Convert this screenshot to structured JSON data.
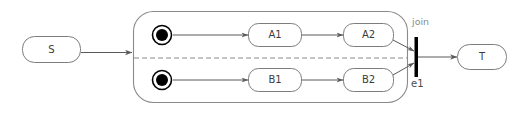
{
  "diagram": {
    "canvas": {
      "width": 518,
      "height": 122,
      "background": "#ffffff"
    },
    "colors": {
      "node_stroke": "#7d7d7d",
      "composite_stroke": "#8a8a8a",
      "edge_stroke": "#5a5a5a",
      "text": "#3b3b3b",
      "annotation_text": "#8a8a8a",
      "initial_state_fill": "#000000",
      "join_bar_fill": "#000000"
    },
    "states": {
      "source": {
        "label": "S",
        "name": "state-s"
      },
      "target": {
        "label": "T",
        "name": "state-t"
      },
      "region_top": [
        {
          "label": "A1",
          "name": "state-a1"
        },
        {
          "label": "A2",
          "name": "state-a2"
        }
      ],
      "region_bottom": [
        {
          "label": "B1",
          "name": "state-b1"
        },
        {
          "label": "B2",
          "name": "state-b2"
        }
      ]
    },
    "pseudostates": {
      "initial_top": {
        "name": "initial-state-top",
        "kind": "initial"
      },
      "initial_bottom": {
        "name": "initial-state-bottom",
        "kind": "initial"
      },
      "join": {
        "name": "join-bar",
        "kind": "join"
      }
    },
    "annotations": {
      "join_label": "join",
      "join_event_label": "e1"
    }
  }
}
